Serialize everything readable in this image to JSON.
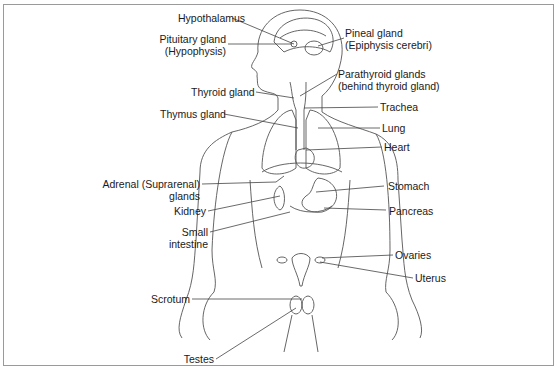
{
  "diagram": {
    "labels": {
      "hypothalamus": "Hypothalamus",
      "pituitary_1": "Pituitary gland",
      "pituitary_2": "(Hypophysis)",
      "pineal_1": "Pineal gland",
      "pineal_2": "(Epiphysis cerebri)",
      "thyroid": "Thyroid gland",
      "parathyroid_1": "Parathyroid glands",
      "parathyroid_2": "(behind thyroid gland)",
      "thymus": "Thymus gland",
      "trachea": "Trachea",
      "lung": "Lung",
      "heart": "Heart",
      "adrenal_1": "Adrenal (Suprarenal)",
      "adrenal_2": "glands",
      "stomach": "Stomach",
      "kidney": "Kidney",
      "pancreas": "Pancreas",
      "small_intestine_1": "Small",
      "small_intestine_2": "intestine",
      "ovaries": "Ovaries",
      "uterus": "Uterus",
      "scrotum": "Scrotum",
      "testes": "Testes"
    },
    "colors": {
      "line": "#555555",
      "text": "#1a1a1a",
      "border": "#9a9a9a"
    }
  }
}
